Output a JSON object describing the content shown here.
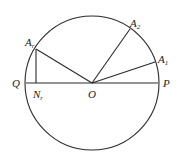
{
  "diagram": {
    "type": "geometry-circle",
    "circle": {
      "center": "O",
      "cx": 92,
      "cy": 83,
      "r": 67
    },
    "points": {
      "O": {
        "label": "O",
        "sub": "",
        "x": 92,
        "y": 83
      },
      "P": {
        "label": "P",
        "sub": "",
        "x": 158,
        "y": 83
      },
      "Q": {
        "label": "Q",
        "sub": "",
        "x": 26,
        "y": 83
      },
      "A1": {
        "label": "A",
        "sub": "1",
        "x": 155,
        "y": 62
      },
      "A2": {
        "label": "A",
        "sub": "2",
        "x": 130,
        "y": 29
      },
      "Ar": {
        "label": "A",
        "sub": "r",
        "x": 36,
        "y": 49
      },
      "Nr": {
        "label": "N",
        "sub": "r",
        "x": 36,
        "y": 83
      }
    },
    "segments": [
      [
        "Q",
        "P"
      ],
      [
        "O",
        "A1"
      ],
      [
        "O",
        "A2"
      ],
      [
        "O",
        "Ar"
      ],
      [
        "Ar",
        "Nr"
      ]
    ]
  }
}
